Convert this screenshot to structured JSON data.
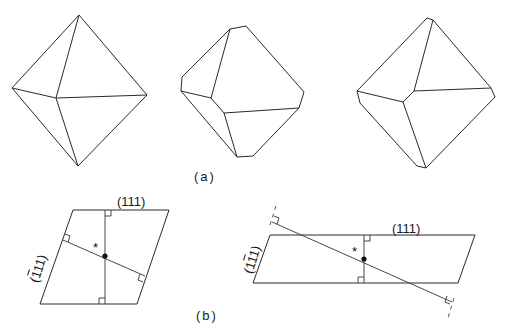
{
  "figure": {
    "panel_a": {
      "caption": "(a)",
      "crystals": [
        {
          "name": "octahedron",
          "description": "regular octahedron"
        },
        {
          "name": "truncated-octahedron-1",
          "description": "octahedron with truncated vertices"
        },
        {
          "name": "truncated-octahedron-2",
          "description": "octahedron with small truncations"
        }
      ]
    },
    "panel_b": {
      "caption": "(b)",
      "left": {
        "top_label": "(111)",
        "side_label_prefix": "(",
        "side_label_bar": "1",
        "side_label_suffix": "11)",
        "center_marker": "*"
      },
      "right": {
        "top_label": "(111)",
        "side_label_prefix": "(1",
        "side_label_bar": "1",
        "side_label_suffix": "1)",
        "center_marker": "*"
      }
    }
  }
}
